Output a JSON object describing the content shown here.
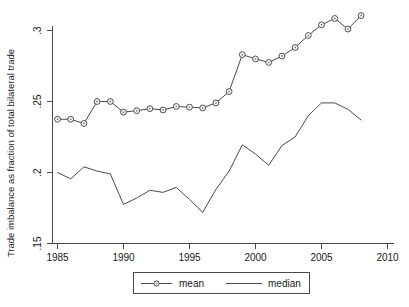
{
  "chart_data": {
    "type": "line",
    "title": "",
    "xlabel": "",
    "ylabel": "Trade imbalance as fraction of total bilateral trade",
    "xlim": [
      1985,
      2010
    ],
    "ylim": [
      0.15,
      0.3
    ],
    "grid": false,
    "legend_position": "bottom",
    "xticks": [
      "1985",
      "1990",
      "1995",
      "2000",
      "2005",
      "2010"
    ],
    "xtick_values": [
      1985,
      1990,
      1995,
      2000,
      2005,
      2010
    ],
    "yticks": [
      ".15",
      ".2",
      ".25",
      ".3"
    ],
    "ytick_values": [
      0.15,
      0.2,
      0.25,
      0.3
    ],
    "x": [
      1985,
      1986,
      1987,
      1988,
      1989,
      1990,
      1991,
      1992,
      1993,
      1994,
      1995,
      1996,
      1997,
      1998,
      1999,
      2000,
      2001,
      2002,
      2003,
      2004,
      2005,
      2006,
      2007,
      2008
    ],
    "series": [
      {
        "name": "mean",
        "marker": "circle",
        "values": [
          0.2375,
          0.2375,
          0.2345,
          0.25,
          0.25,
          0.2425,
          0.2435,
          0.245,
          0.244,
          0.2465,
          0.246,
          0.2455,
          0.249,
          0.257,
          0.283,
          0.28,
          0.2775,
          0.282,
          0.288,
          0.2965,
          0.304,
          0.3085,
          0.301,
          0.3105
        ]
      },
      {
        "name": "median",
        "marker": "none",
        "values": [
          0.2,
          0.1955,
          0.204,
          0.201,
          0.199,
          0.1775,
          0.182,
          0.1875,
          0.186,
          0.1895,
          0.181,
          0.172,
          0.188,
          0.201,
          0.2195,
          0.213,
          0.205,
          0.219,
          0.225,
          0.24,
          0.249,
          0.249,
          0.2445,
          0.237
        ]
      }
    ]
  },
  "legend": {
    "entries": [
      {
        "label": "mean"
      },
      {
        "label": "median"
      }
    ]
  },
  "colors": {
    "line": "#4a4a4a",
    "marker_fill": "#ffffff",
    "text": "#1a1a1a",
    "background": "#ffffff"
  }
}
